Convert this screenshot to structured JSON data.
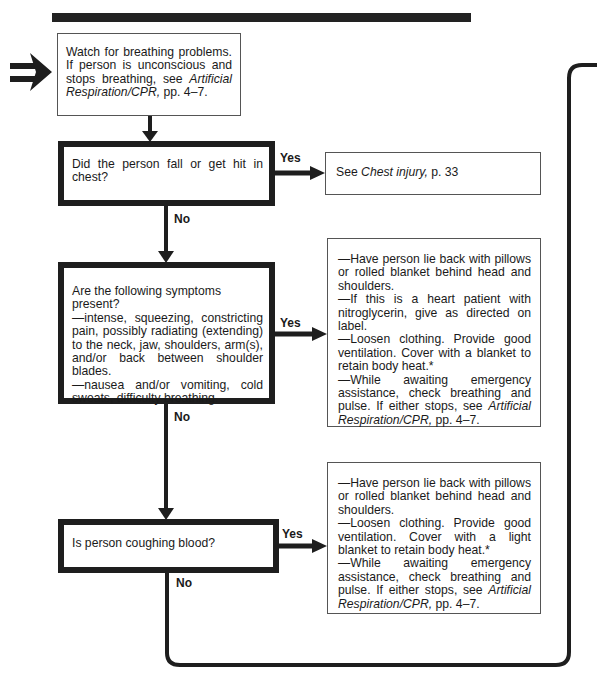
{
  "entry_arrow": {
    "icon": "double-right-arrow-icon"
  },
  "nodes": {
    "start": {
      "text_before": "Watch for breathing problems. If person is unconscious and stops breathing, see ",
      "ref": "Artificial Respiration/CPR,",
      "text_after": " pp. 4–7."
    },
    "q1": {
      "text": "Did the person fall or get hit in chest?"
    },
    "q1_yes": {
      "text_before": "See ",
      "ref": "Chest injury,",
      "text_after": " p. 33"
    },
    "q2": {
      "intro": "Are the following symptoms present?",
      "items": [
        "—intense, squeezing, constricting pain, possibly radiating (extending) to the neck, jaw, shoulders, arm(s), and/or back between shoulder blades.",
        "—nausea and/or vomiting, cold sweats, difficulty breathing."
      ]
    },
    "q2_yes": {
      "items": [
        "—Have person lie back with pillows or rolled blanket behind head and shoulders.",
        "—If this is a heart patient with nitroglycerin, give as directed on label.",
        "—Loosen clothing. Provide good ventilation. Cover with a blanket to retain body heat.*"
      ],
      "last_before": "—While awaiting emergency assistance, check breathing and pulse. If either stops, see ",
      "last_ref": "Artificial Respiration/CPR,",
      "last_after": " pp. 4–7."
    },
    "q3": {
      "text": "Is person coughing blood?"
    },
    "q3_yes": {
      "items": [
        "—Have person lie back with pillows or rolled blanket behind head and shoulders.",
        "—Loosen clothing. Provide good ventilation. Cover with a light blanket to retain body heat.*"
      ],
      "last_before": "—While awaiting emergency assistance, check breathing and pulse. If either stops, see ",
      "last_ref": "Artificial Respiration/CPR,",
      "last_after": " pp. 4–7."
    }
  },
  "labels": {
    "yes": "Yes",
    "no": "No"
  },
  "colors": {
    "line": "#1e1e1e",
    "thin_border": "#555555",
    "background": "#ffffff"
  }
}
